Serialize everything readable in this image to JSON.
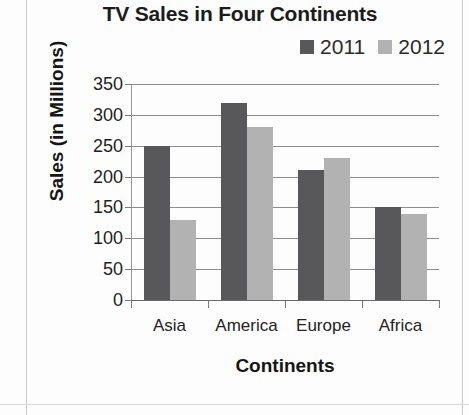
{
  "chart_data": {
    "type": "bar",
    "title": "TV Sales in Four Continents",
    "xlabel": "Continents",
    "ylabel": "Sales (in Millions)",
    "categories": [
      "Asia",
      "America",
      "Europe",
      "Africa"
    ],
    "series": [
      {
        "name": "2011",
        "values": [
          250,
          320,
          210,
          150
        ],
        "color": "#58585a"
      },
      {
        "name": "2012",
        "values": [
          130,
          280,
          230,
          140
        ],
        "color": "#b2b2b2"
      }
    ],
    "ylim": [
      0,
      350
    ],
    "yticks": [
      0,
      50,
      100,
      150,
      200,
      250,
      300,
      350
    ],
    "ytick_labels": [
      "0",
      "50",
      "100",
      "150",
      "200",
      "250",
      "300",
      "350"
    ],
    "grid": true,
    "legend_position": "top-right"
  },
  "legend": {
    "entries": [
      {
        "label": "2011",
        "color": "#58585a"
      },
      {
        "label": "2012",
        "color": "#b2b2b2"
      }
    ]
  }
}
